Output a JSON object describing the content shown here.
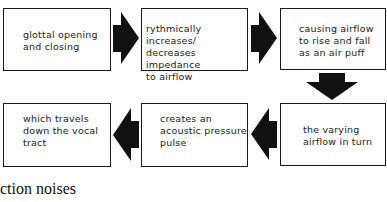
{
  "diagram": {
    "type": "flowchart",
    "boxes": [
      {
        "id": 1,
        "text": "glottal opening\nand closing"
      },
      {
        "id": 2,
        "text": "rythmically increases/\ndecreases impedance\nto airflow"
      },
      {
        "id": 3,
        "text": "causing airflow\nto rise and fall\nas an air puff"
      },
      {
        "id": 4,
        "text": "the varying\nairflow in turn"
      },
      {
        "id": 5,
        "text": "creates an\nacoustic pressure\npulse"
      },
      {
        "id": 6,
        "text": "which travels\ndown the vocal\ntract"
      }
    ],
    "arrows": [
      {
        "from": 1,
        "to": 2,
        "direction": "right"
      },
      {
        "from": 2,
        "to": 3,
        "direction": "right"
      },
      {
        "from": 3,
        "to": 4,
        "direction": "down"
      },
      {
        "from": 4,
        "to": 5,
        "direction": "left"
      },
      {
        "from": 5,
        "to": 6,
        "direction": "left"
      }
    ],
    "arrow_color": "#111111",
    "border_color": "#1a1a1a"
  },
  "caption": "ction noises"
}
